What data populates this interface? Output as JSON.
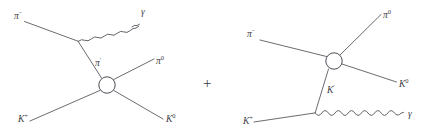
{
  "figure": {
    "kind": "feynman-diagram-pair",
    "background_color": "#ffffff",
    "stroke_color": "#5a5a62",
    "label_color": "#3d3d45",
    "operator": "+",
    "operator_position": {
      "x": 208,
      "y": 88
    }
  },
  "diagram_left": {
    "name": "radiative-pion-emission-diagram",
    "blob": {
      "cx": 107,
      "cy": 85,
      "r": 8.2,
      "label": "interaction-blob"
    },
    "photon_vertex": {
      "x": 78,
      "y": 41
    },
    "labels": {
      "incoming_pion": {
        "base": "π",
        "sup": "−",
        "x": 14,
        "y": 18
      },
      "photon": {
        "base": "γ",
        "sup": "",
        "x": 142,
        "y": 14
      },
      "internal_pion": {
        "base": "π",
        "sup": "′",
        "x": 95,
        "y": 64
      },
      "outgoing_pion_neutral": {
        "base": "π",
        "sup": "0",
        "x": 156,
        "y": 63
      },
      "incoming_kaon_plus": {
        "base": "K",
        "sup": "+",
        "x": 18,
        "y": 122
      },
      "outgoing_kaon_neutral": {
        "base": "K",
        "sup": "0",
        "x": 166,
        "y": 122
      }
    },
    "segments": {
      "pion_in": "from (24,22) to (78,41)",
      "photon_wave": "wavy from (78,41) to (138,13)",
      "internal_pion": "from (78,41) to (101,78)",
      "pion0_out": "from (114,79) to (154,59)",
      "kaon_plus_in": "from (30,121) to (100,91)",
      "kaon0_out": "from (114,91) to (163,119)"
    }
  },
  "diagram_right": {
    "name": "radiative-kaon-emission-diagram",
    "blob": {
      "cx": 334,
      "cy": 61,
      "r": 8.2,
      "label": "interaction-blob"
    },
    "photon_vertex": {
      "x": 315,
      "y": 113
    },
    "labels": {
      "incoming_pion": {
        "base": "π",
        "sup": "−",
        "x": 247,
        "y": 36
      },
      "outgoing_pion_neutral": {
        "base": "π",
        "sup": "0",
        "x": 383,
        "y": 17
      },
      "outgoing_kaon_neutral": {
        "base": "K",
        "sup": "0",
        "x": 399,
        "y": 86
      },
      "internal_kaon": {
        "base": "K",
        "sup": "′",
        "x": 327,
        "y": 92
      },
      "incoming_kaon_plus": {
        "base": "K",
        "sup": "+",
        "x": 243,
        "y": 124
      },
      "photon": {
        "base": "γ",
        "sup": "",
        "x": 409,
        "y": 116
      }
    },
    "segments": {
      "pion_in": "from (260,40) to (327,56)",
      "pion0_out": "from (341,55) to (381,14)",
      "kaon0_out": "from (342,64) to (396,82)",
      "internal_kaon": "from (328,69) to (315,113)",
      "kaon_plus_in": "from (254,122) to (315,113)",
      "photon_wave": "wavy from (315,113) to (403,112)"
    }
  }
}
